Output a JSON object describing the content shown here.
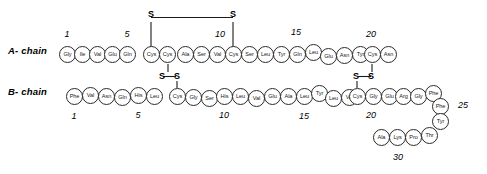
{
  "diagram": {
    "title_text": "",
    "molecule": "insulin primary structure",
    "stroke_color": "#2b2b2b",
    "background": "#ffffff"
  },
  "chains": {
    "a": {
      "label": "A- chain",
      "residues": [
        "Gly",
        "Ile",
        "Val",
        "Glu",
        "Gln",
        "Cys",
        "Cys",
        "Ala",
        "Ser",
        "Val",
        "Cys",
        "Ser",
        "Leu",
        "Tyr",
        "Gln",
        "Leu",
        "Glu",
        "Asn",
        "Tyr",
        "Cys",
        "Asn"
      ],
      "numbers": [
        "1",
        "5",
        "10",
        "15",
        "20"
      ],
      "number_positions": [
        1,
        5,
        10,
        15,
        20
      ]
    },
    "b": {
      "label": "B- chain",
      "residues": [
        "Phe",
        "Val",
        "Asn",
        "Gln",
        "His",
        "Leu",
        "Cys",
        "Gly",
        "Ser",
        "His",
        "Leu",
        "Val",
        "Glu",
        "Ala",
        "Leu",
        "Tyr",
        "Leu",
        "Val",
        "Cys",
        "Gly",
        "Glu",
        "Arg",
        "Gly",
        "Phe",
        "Phe",
        "Tyr",
        "Thr",
        "Pro",
        "Lys",
        "Ala"
      ],
      "numbers": [
        "1",
        "5",
        "10",
        "15",
        "20",
        "25",
        "30"
      ],
      "number_positions": [
        1,
        5,
        10,
        15,
        20,
        25,
        30
      ]
    }
  },
  "disulfide_bonds": [
    {
      "name": "A6-A11",
      "sulfur_labels": [
        "S",
        "S"
      ]
    },
    {
      "name": "A7-B7",
      "sulfur_labels": [
        "S",
        "S"
      ]
    },
    {
      "name": "A20-B19",
      "sulfur_labels": [
        "S",
        "S"
      ]
    }
  ],
  "sulfur_glyph": "S"
}
